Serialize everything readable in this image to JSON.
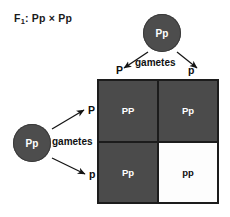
{
  "figure": {
    "title_prefix": "F",
    "title_sub": "1",
    "title_rest": ": Pp × Pp",
    "background_color": "#ffffff"
  },
  "parents": {
    "top": {
      "genotype": "Pp",
      "fill_color": "#4d4d4d",
      "text_color": "#ffffff",
      "gametes_label": "gametes",
      "gamete_left": "P",
      "gamete_right": "p"
    },
    "left": {
      "genotype": "Pp",
      "fill_color": "#4d4d4d",
      "text_color": "#ffffff",
      "gametes_label": "gametes",
      "gamete_top": "P",
      "gamete_bottom": "p"
    }
  },
  "punnett_square": {
    "border_color": "#1c1c1c",
    "dark_fill": "#4b4b4b",
    "light_fill": "#fdfdfd",
    "cells": [
      {
        "genotype": "PP",
        "shade": "dark"
      },
      {
        "genotype": "Pp",
        "shade": "dark"
      },
      {
        "genotype": "Pp",
        "shade": "dark"
      },
      {
        "genotype": "pp",
        "shade": "light"
      }
    ]
  }
}
